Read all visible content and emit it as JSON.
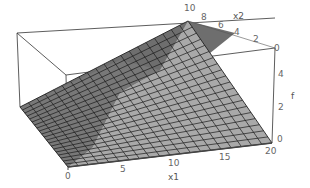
{
  "chart_data": {
    "type": "surface3d",
    "title": "",
    "xlabel": "x1",
    "ylabel": "x2",
    "zlabel": "f",
    "x1_range": [
      0,
      20
    ],
    "x2_range": [
      0,
      10
    ],
    "f_range": [
      0,
      5
    ],
    "x1_ticks": [
      "0",
      "5",
      "10",
      "15",
      "20"
    ],
    "x2_ticks": [
      "10",
      "8",
      "6",
      "4",
      "2",
      "0"
    ],
    "f_ticks": [
      "0",
      "2",
      "4"
    ],
    "surface_description": "Piecewise-linear surface over grid; f = min-type function rising to peak at x1=0..., x2=10; dark shaded region on left slope, light gray on right plane",
    "grid": true,
    "boxed": true,
    "colors": {
      "dark_face": "#6e6e6e",
      "light_face": "#a8a8a8",
      "mesh": "#1a1a1a",
      "box": "#333333"
    }
  },
  "labels": {
    "x1": "x1",
    "x2": "x2",
    "f": "f",
    "x1_ticks": [
      "0",
      "5",
      "10",
      "15",
      "20"
    ],
    "x2_ticks": [
      "10",
      "8",
      "6",
      "4",
      "2",
      "0"
    ],
    "f_ticks": [
      "0",
      "2",
      "4"
    ]
  }
}
